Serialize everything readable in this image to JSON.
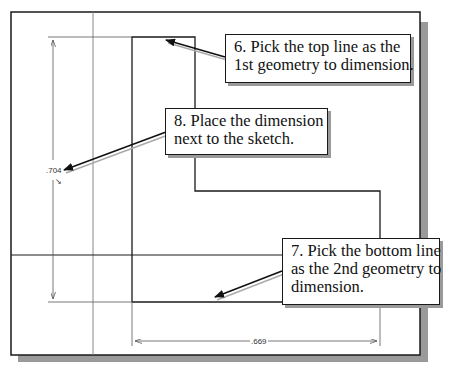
{
  "diagram": {
    "type": "CAD sketch dimensioning tutorial",
    "dimensions": {
      "vertical_value": ".704",
      "horizontal_value": ".669"
    },
    "callouts": [
      {
        "id": "step-6",
        "lines": [
          "6. Pick the top line as the",
          "1st geometry to dimension."
        ]
      },
      {
        "id": "step-8",
        "lines": [
          "8. Place the dimension",
          "next to the sketch."
        ]
      },
      {
        "id": "step-7",
        "lines": [
          "7. Pick the bottom line",
          "as the 2nd geometry to",
          "dimension."
        ]
      }
    ],
    "colors": {
      "line": "#1a1a1a",
      "construction": "#888888",
      "shadow": "#9a9a9a",
      "background": "#ffffff"
    }
  }
}
